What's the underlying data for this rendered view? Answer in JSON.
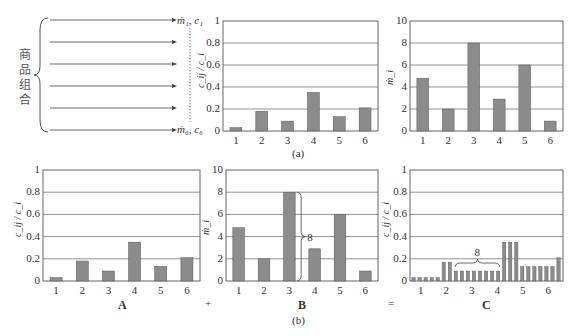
{
  "diagram": {
    "left_label_chars": [
      "商",
      "品",
      "组",
      "合"
    ],
    "flow_top_label": "ṁ₁, c₁",
    "flow_bottom_label": "ṁ₆, c₆",
    "arrow_count": 6,
    "caption_a": "(a)",
    "caption_b": "(b)",
    "label_A": "A",
    "label_B": "B",
    "label_C": "C",
    "op_plus": "+",
    "op_equals": "=",
    "brace_B_label": "8",
    "brace_C_label": "8",
    "colors": {
      "bar": "#8c8c8c",
      "bar_edge": "#555555",
      "grid": "#777777",
      "axis": "#555555"
    }
  },
  "chart_data": [
    {
      "id": "a-left",
      "type": "bar",
      "title": "",
      "xlabel": "",
      "ylabel": "c_ij / c_i",
      "categories": [
        "1",
        "2",
        "3",
        "4",
        "5",
        "6"
      ],
      "values": [
        0.03,
        0.18,
        0.09,
        0.35,
        0.13,
        0.21
      ],
      "ylim": [
        0,
        1
      ],
      "yticks": [
        "0",
        "0.2",
        "0.4",
        "0.6",
        "0.8",
        "1"
      ],
      "grid": true
    },
    {
      "id": "a-right",
      "type": "bar",
      "title": "",
      "xlabel": "",
      "ylabel": "ṁ_i",
      "categories": [
        "1",
        "2",
        "3",
        "4",
        "5",
        "6"
      ],
      "values": [
        4.8,
        2,
        8,
        2.9,
        6,
        0.9
      ],
      "ylim": [
        0,
        10
      ],
      "yticks": [
        "0",
        "2",
        "4",
        "6",
        "8",
        "10"
      ],
      "grid": true
    },
    {
      "id": "b-A",
      "type": "bar",
      "title": "A",
      "xlabel": "",
      "ylabel": "c_ij / c_i",
      "categories": [
        "1",
        "2",
        "3",
        "4",
        "5",
        "6"
      ],
      "values": [
        0.03,
        0.18,
        0.09,
        0.35,
        0.13,
        0.21
      ],
      "ylim": [
        0,
        1
      ],
      "yticks": [
        "0",
        "0.2",
        "0.4",
        "0.6",
        "0.8",
        "1"
      ],
      "grid": true
    },
    {
      "id": "b-B",
      "type": "bar",
      "title": "B",
      "xlabel": "",
      "ylabel": "ṁ_i",
      "categories": [
        "1",
        "2",
        "3",
        "4",
        "5",
        "6"
      ],
      "values": [
        4.8,
        2,
        8,
        2.9,
        6,
        0.9
      ],
      "ylim": [
        0,
        10
      ],
      "yticks": [
        "0",
        "2",
        "4",
        "6",
        "8",
        "10"
      ],
      "grid": true,
      "annotation": {
        "bar": "3",
        "text": "8",
        "type": "brace"
      }
    },
    {
      "id": "b-C",
      "type": "bar",
      "title": "C",
      "xlabel": "",
      "ylabel": "c_ij / c_i",
      "categories": [
        "1",
        "2",
        "3",
        "4",
        "5",
        "6"
      ],
      "groups": [
        {
          "category": "1",
          "count": 5,
          "value": 0.03
        },
        {
          "category": "2",
          "count": 2,
          "value": 0.17
        },
        {
          "category": "3",
          "count": 8,
          "value": 0.09
        },
        {
          "category": "4",
          "count": 3,
          "value": 0.35
        },
        {
          "category": "5",
          "count": 6,
          "value": 0.13
        },
        {
          "category": "6",
          "count": 1,
          "value": 0.21
        }
      ],
      "ylim": [
        0,
        1
      ],
      "yticks": [
        "0",
        "0.2",
        "0.4",
        "0.6",
        "0.8",
        "1"
      ],
      "grid": true,
      "annotation": {
        "group": "3",
        "text": "8",
        "type": "brace"
      }
    }
  ]
}
